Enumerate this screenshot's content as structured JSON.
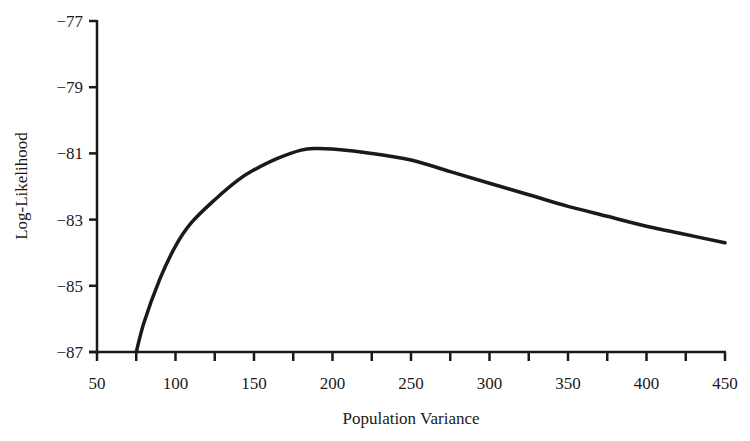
{
  "chart_data": {
    "type": "line",
    "title": "",
    "xlabel": "Population Variance",
    "ylabel": "Log-Likelihood",
    "xlim": [
      50,
      450
    ],
    "ylim": [
      -87,
      -77
    ],
    "x_ticks": [
      50,
      100,
      150,
      200,
      250,
      300,
      350,
      400,
      450
    ],
    "x_tick_labels": [
      "50",
      "100",
      "150",
      "200",
      "250",
      "300",
      "350",
      "400",
      "450"
    ],
    "x_minor_tick_step": 25,
    "y_ticks": [
      -87,
      -85,
      -83,
      -81,
      -79,
      -77
    ],
    "y_tick_labels": [
      "−87",
      "−85",
      "−83",
      "−81",
      "−79",
      "−77"
    ],
    "grid": false,
    "legend": null,
    "series": [
      {
        "name": "Log-Likelihood",
        "color": "#1a1a1a",
        "x": [
          75,
          80,
          90,
          100,
          110,
          125,
          140,
          150,
          165,
          180,
          190,
          200,
          225,
          250,
          275,
          300,
          325,
          350,
          375,
          400,
          425,
          450
        ],
        "values": [
          -87.0,
          -86.1,
          -84.8,
          -83.8,
          -83.1,
          -82.4,
          -81.8,
          -81.5,
          -81.15,
          -80.9,
          -80.85,
          -80.87,
          -81.0,
          -81.2,
          -81.55,
          -81.9,
          -82.25,
          -82.6,
          -82.9,
          -83.2,
          -83.45,
          -83.7
        ]
      }
    ]
  }
}
